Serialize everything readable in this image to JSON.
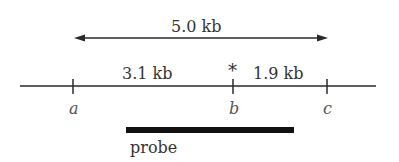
{
  "diagram": {
    "total_span_label": "5.0 kb",
    "segment_left_label": "3.1 kb",
    "segment_right_label": "1.9 kb",
    "mutation_marker": "*",
    "sites": [
      {
        "name": "a"
      },
      {
        "name": "b"
      },
      {
        "name": "c"
      }
    ],
    "probe_label": "probe",
    "colors": {
      "line": "#2a2a2a",
      "probe": "#111111"
    }
  }
}
